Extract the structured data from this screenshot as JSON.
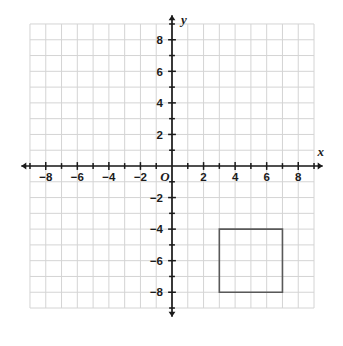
{
  "chart_data": {
    "type": "scatter",
    "title": "",
    "xlabel": "x",
    "ylabel": "y",
    "xlim": [
      -9,
      9
    ],
    "ylim": [
      -9,
      9
    ],
    "grid": true,
    "grid_step": 1,
    "tick_step": 1,
    "labeled_tick_step": 2,
    "legend": "none",
    "origin_label": "O",
    "x_tick_labels": [
      "-8",
      "-6",
      "-4",
      "-2",
      "2",
      "4",
      "6",
      "8"
    ],
    "x_tick_values": [
      -8,
      -6,
      -4,
      -2,
      2,
      4,
      6,
      8
    ],
    "y_tick_labels": [
      "8",
      "6",
      "4",
      "2",
      "-2",
      "-4",
      "-6",
      "-8"
    ],
    "y_tick_values": [
      8,
      6,
      4,
      2,
      -2,
      -4,
      -6,
      -8
    ],
    "shapes": [
      {
        "name": "square",
        "kind": "polygon",
        "closed": true,
        "vertices": [
          [
            3,
            -4
          ],
          [
            7,
            -4
          ],
          [
            7,
            -8
          ],
          [
            3,
            -8
          ]
        ],
        "stroke": "#595959",
        "fill": "none",
        "stroke_width": 1.6,
        "width_units": 4,
        "height_units": 4
      }
    ],
    "colors": {
      "grid_line": "#d4d4d4",
      "axis_line": "#1b1b1b",
      "background": "#ffffff",
      "shape_stroke": "#595959",
      "text": "#1b1b1b"
    }
  },
  "axes": {
    "x_axis_name": "x",
    "y_axis_name": "y",
    "origin": "O"
  },
  "x_labels": [
    {
      "text": "-8",
      "value": -8
    },
    {
      "text": "-6",
      "value": -6
    },
    {
      "text": "-4",
      "value": -4
    },
    {
      "text": "-2",
      "value": -2
    },
    {
      "text": "2",
      "value": 2
    },
    {
      "text": "4",
      "value": 4
    },
    {
      "text": "6",
      "value": 6
    },
    {
      "text": "8",
      "value": 8
    }
  ],
  "y_labels": [
    {
      "text": "8",
      "value": 8
    },
    {
      "text": "6",
      "value": 6
    },
    {
      "text": "4",
      "value": 4
    },
    {
      "text": "2",
      "value": 2
    },
    {
      "text": "-2",
      "value": -2
    },
    {
      "text": "-4",
      "value": -4
    },
    {
      "text": "-6",
      "value": -6
    },
    {
      "text": "-8",
      "value": -8
    }
  ]
}
